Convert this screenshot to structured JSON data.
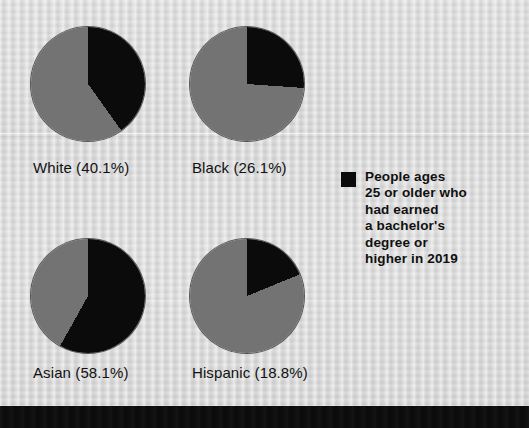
{
  "figure": {
    "background_color": "#d9d9d9",
    "slice_color_highlight": "#0b0b0b",
    "slice_color_remainder": "#737373",
    "bottom_bar_color": "#0a0a0a"
  },
  "legend": {
    "swatch_color": "#0b0b0b",
    "swatch_name": "legend-swatch-black",
    "lines": [
      "People ages",
      "25 or older who",
      "had earned",
      "a bachelor's",
      "degree or",
      "higher in 2019"
    ],
    "full_text": "People ages 25 or older who had earned a bachelor's degree or higher in 2019"
  },
  "chart_data": {
    "type": "pie",
    "title": "",
    "subtitle": "",
    "xlabel": "",
    "ylabel": "",
    "legend_position": "right",
    "grid": false,
    "series_name": "People ages 25 or older who had earned a bachelor's degree or higher in 2019",
    "value_unit": "percent",
    "categories": [
      "White",
      "Black",
      "Asian",
      "Hispanic"
    ],
    "values": [
      40.1,
      26.1,
      58.1,
      18.8
    ],
    "remainders": [
      59.9,
      73.9,
      41.9,
      81.2
    ],
    "slices": [
      {
        "category": "White",
        "value": 40.1,
        "remainder": 59.9,
        "label": "White (40.1%)",
        "start_angle_deg": 0,
        "sweep_angle_deg": 144.4
      },
      {
        "category": "Black",
        "value": 26.1,
        "remainder": 73.9,
        "label": "Black (26.1%)",
        "start_angle_deg": 0,
        "sweep_angle_deg": 94.0
      },
      {
        "category": "Asian",
        "value": 58.1,
        "remainder": 41.9,
        "label": "Asian (58.1%)",
        "start_angle_deg": 0,
        "sweep_angle_deg": 209.2
      },
      {
        "category": "Hispanic",
        "value": 18.8,
        "remainder": 81.2,
        "label": "Hispanic (18.8%)",
        "start_angle_deg": 0,
        "sweep_angle_deg": 67.7
      }
    ]
  }
}
